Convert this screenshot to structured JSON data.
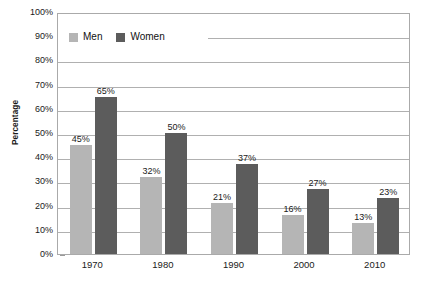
{
  "chart_data": {
    "type": "bar",
    "title": "",
    "subtitle": "",
    "xlabel": "",
    "ylabel": "Percentage",
    "categories": [
      "1970",
      "1980",
      "1990",
      "2000",
      "2010"
    ],
    "series": [
      {
        "name": "Men",
        "color": "#b5b5b5",
        "values": [
          45,
          32,
          21,
          16,
          13
        ],
        "labels": [
          "45%",
          "32%",
          "21%",
          "16%",
          "13%"
        ]
      },
      {
        "name": "Women",
        "color": "#5c5c5c",
        "values": [
          65,
          50,
          37,
          27,
          23
        ],
        "labels": [
          "65%",
          "50%",
          "37%",
          "27%",
          "23%"
        ]
      }
    ],
    "ylim": [
      0,
      100
    ],
    "ytick_step": 10,
    "ytick_labels": [
      "100%",
      "90%",
      "80%",
      "70%",
      "60%",
      "50%",
      "40%",
      "30%",
      "20%",
      "10%",
      "0%"
    ],
    "ytick_values": [
      100,
      90,
      80,
      70,
      60,
      50,
      40,
      30,
      20,
      10,
      0
    ],
    "grid": "horizontal",
    "legend_position": "top-left-inside",
    "legend": [
      {
        "label": "Men",
        "color": "#b5b5b5"
      },
      {
        "label": "Women",
        "color": "#5c5c5c"
      }
    ],
    "plot_border_color": "#aaaaaa",
    "gridline_color": "#b0b0b0",
    "background": "#ffffff"
  }
}
